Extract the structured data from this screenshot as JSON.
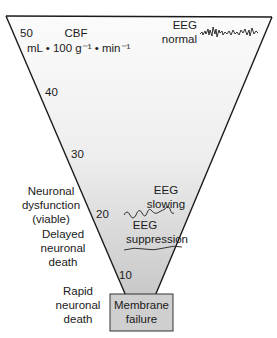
{
  "diagram": {
    "axis": {
      "title": "CBF",
      "units": "mL • 100 g⁻¹ • min⁻¹",
      "ticks": [
        "50",
        "40",
        "30",
        "20",
        "10"
      ]
    },
    "eeg_labels": {
      "normal": [
        "EEG",
        "normal"
      ],
      "slowing": [
        "EEG",
        "slowing"
      ],
      "suppression": [
        "EEG",
        "suppression"
      ]
    },
    "outcome_labels": {
      "dysfunction": [
        "Neuronal",
        "dysfunction",
        "(viable)"
      ],
      "delayed": [
        "Delayed",
        "neuronal",
        "death"
      ],
      "rapid": [
        "Rapid",
        "neuronal",
        "death"
      ]
    },
    "bottom_box": [
      "Membrane",
      "failure"
    ],
    "colors": {
      "line": "#1a1a1a",
      "fill_top": "#fafafa",
      "fill_bottom": "#c9c9c9",
      "box_fill": "#d0d0d0",
      "text": "#1a1a1a"
    }
  }
}
